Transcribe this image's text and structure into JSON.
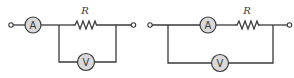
{
  "diagram": {
    "type": "circuit-schematics",
    "colors": {
      "wire": "#3a3a3a",
      "meter_fill": "#d9d9d9",
      "background": "#ffffff"
    },
    "circuits": [
      {
        "id": "circuit-a",
        "description": "Ammeter in series before the resistor; voltmeter connected in parallel across the resistor only",
        "ammeter": {
          "label": "A"
        },
        "resistor": {
          "label": "R"
        },
        "voltmeter": {
          "label": "V"
        }
      },
      {
        "id": "circuit-b",
        "description": "Ammeter and resistor in series; voltmeter connected in parallel across both the ammeter and the resistor",
        "ammeter": {
          "label": "A"
        },
        "resistor": {
          "label": "R"
        },
        "voltmeter": {
          "label": "V"
        }
      }
    ]
  }
}
